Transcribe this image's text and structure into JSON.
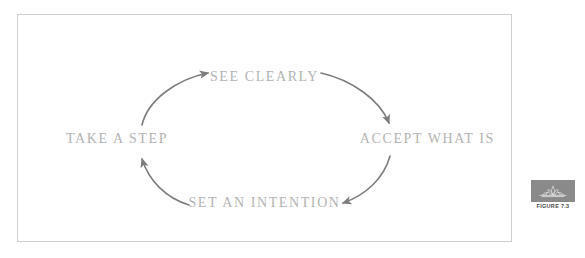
{
  "figure": {
    "caption": "FIGURE 7.3",
    "badge_icon": "lotus-ornament-icon",
    "badge_color": "#8a8a8a",
    "frame_border_color": "#cfcfcf",
    "background_color": "#ffffff"
  },
  "diagram": {
    "type": "cycle",
    "label_color": "#b4b4b4",
    "arrow_color": "#7d7d7d",
    "steps": [
      {
        "id": "see-clearly",
        "label": "SEE CLEARLY",
        "position": "top"
      },
      {
        "id": "accept-what-is",
        "label": "ACCEPT WHAT IS",
        "position": "right"
      },
      {
        "id": "set-an-intention",
        "label": "SET AN INTENTION",
        "position": "bottom"
      },
      {
        "id": "take-a-step",
        "label": "TAKE A STEP",
        "position": "left"
      }
    ],
    "arrows": [
      {
        "id": "arrow-see-to-accept",
        "from": "see-clearly",
        "to": "accept-what-is"
      },
      {
        "id": "arrow-accept-to-intention",
        "from": "accept-what-is",
        "to": "set-an-intention"
      },
      {
        "id": "arrow-intention-to-step",
        "from": "set-an-intention",
        "to": "take-a-step"
      },
      {
        "id": "arrow-step-to-see",
        "from": "take-a-step",
        "to": "see-clearly"
      }
    ]
  }
}
